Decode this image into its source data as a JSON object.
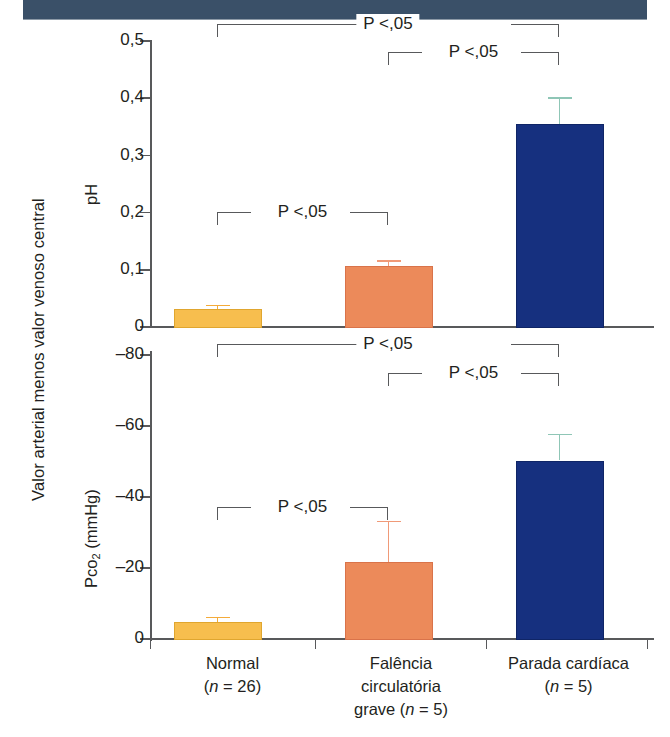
{
  "figure": {
    "outer_ylabel": "Valor arterial menos valor venoso central",
    "significance_label": "P <,05"
  },
  "chart_data": {
    "type": "bar",
    "title": "",
    "xlabel": "",
    "ylabel": "Valor arterial menos valor venoso central",
    "categories": [
      "Normal",
      "Falência circulatória grave",
      "Parada cardíaca"
    ],
    "category_labels": [
      {
        "line1": "Normal",
        "line2": "(n = 26)",
        "line3": ""
      },
      {
        "line1": "Falência",
        "line2": "circulatória",
        "line3": "grave (n = 5)"
      },
      {
        "line1": "Parada cardíaca",
        "line2": "(n = 5)",
        "line3": ""
      }
    ],
    "group_sizes": [
      26,
      5,
      5
    ],
    "panels": [
      {
        "id": "ph",
        "ylabel": "pH",
        "ylim": [
          0,
          0.5
        ],
        "yticks": [
          0,
          0.1,
          0.2,
          0.3,
          0.4,
          0.5
        ],
        "ytick_labels": [
          "0",
          "0,1",
          "0,2",
          "0,3",
          "0,4",
          "0,5"
        ],
        "inverted": false,
        "grid": false,
        "values": [
          0.031,
          0.105,
          0.353
        ],
        "errors": [
          0.007,
          0.011,
          0.047
        ],
        "bar_colors": [
          "#f7be4e",
          "#ec8a5a",
          "#16307f"
        ],
        "annotations": [
          {
            "label": "P <,05",
            "from": "Normal",
            "to": "Parada cardíaca"
          },
          {
            "label": "P <,05",
            "from": "Falência circulatória grave",
            "to": "Parada cardíaca"
          },
          {
            "label": "P <,05",
            "from": "Normal",
            "to": "Falência circulatória grave"
          }
        ]
      },
      {
        "id": "pco2",
        "ylabel": "Pco2 (mmHg)",
        "ylabel_base": "Pco",
        "ylabel_sub": "2",
        "ylabel_tail": " (mmHg)",
        "ylim": [
          -80,
          0
        ],
        "yticks": [
          0,
          -20,
          -40,
          -60,
          -80
        ],
        "ytick_labels": [
          "0",
          "–20",
          "–40",
          "–60",
          "–80"
        ],
        "inverted": true,
        "grid": false,
        "values": [
          -4.6,
          -21.5,
          -50.0
        ],
        "errors": [
          -1.4,
          -11.5,
          -7.5
        ],
        "bar_colors": [
          "#f7be4e",
          "#ec8a5a",
          "#16307f"
        ],
        "annotations": [
          {
            "label": "P <,05",
            "from": "Normal",
            "to": "Parada cardíaca"
          },
          {
            "label": "P <,05",
            "from": "Falência circulatória grave",
            "to": "Parada cardíaca"
          },
          {
            "label": "P <,05",
            "from": "Normal",
            "to": "Falência circulatória grave"
          }
        ]
      }
    ],
    "legend": null,
    "legend_position": "none"
  }
}
